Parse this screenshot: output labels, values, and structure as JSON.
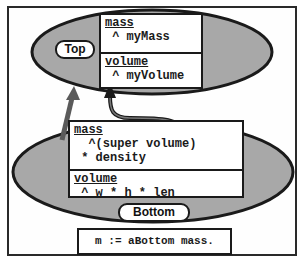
{
  "diagram": {
    "type": "object-inheritance",
    "colors": {
      "ellipse_fill": "#a8a8a8",
      "stroke": "#1a1a1a",
      "arrow_fill": "#5a5a5a",
      "box_fill": "#ffffff"
    },
    "top": {
      "label": "Top",
      "methods": [
        {
          "selector": "mass",
          "body": " ^ myMass"
        },
        {
          "selector": "volume",
          "body": " ^ myVolume"
        }
      ]
    },
    "bottom": {
      "label": "Bottom",
      "methods": [
        {
          "selector": "mass",
          "body_lines": [
            "  ^(super volume)",
            " * density"
          ]
        },
        {
          "selector": "volume",
          "body": " ^ w * h * len"
        }
      ]
    },
    "arrows": [
      {
        "from": "Bottom",
        "to": "Top",
        "kind": "inherits"
      },
      {
        "from": "Bottom.mass (super volume)",
        "to": "Top.volume",
        "kind": "super-send"
      }
    ],
    "code": "m := aBottom mass."
  }
}
